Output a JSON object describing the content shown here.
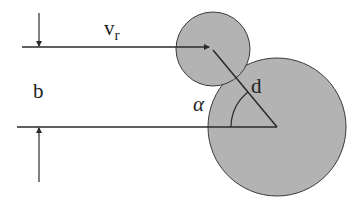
{
  "diagram": {
    "labels": {
      "velocity": "v",
      "velocity_subscript": "r",
      "impact_parameter": "b",
      "distance": "d",
      "angle": "α"
    },
    "colors": {
      "sphere_fill": "#b3b3b3",
      "stroke": "#2a2a2a",
      "background": "#ffffff"
    },
    "small_sphere": {
      "cx": 213,
      "cy": 49,
      "r": 37
    },
    "large_sphere": {
      "cx": 277,
      "cy": 127,
      "r": 69
    }
  }
}
